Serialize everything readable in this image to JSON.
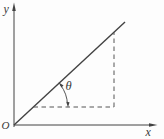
{
  "diagram": {
    "labels": {
      "y_axis": "y",
      "x_axis": "x",
      "origin": "O",
      "angle": "θ"
    },
    "colors": {
      "stroke": "#424242",
      "background": "#fdfdfd"
    }
  }
}
